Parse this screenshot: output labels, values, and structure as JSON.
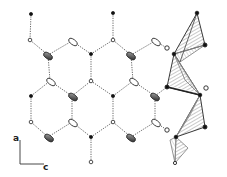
{
  "figure": {
    "axes": {
      "vertical_label": "a",
      "horizontal_label": "c"
    },
    "colors": {
      "line": "#333333",
      "hbond": "#555555",
      "atom_dark": "#111111",
      "atom_open": "#ffffff",
      "hatch": "#666666"
    }
  }
}
